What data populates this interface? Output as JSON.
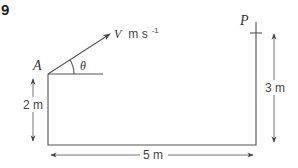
{
  "question_number": "9",
  "points": {
    "A": {
      "label": "A"
    },
    "P": {
      "label": "P"
    }
  },
  "velocity": {
    "symbol": "V",
    "units": "m s",
    "exponent": "-1",
    "angle_symbol": "θ"
  },
  "dimensions": {
    "height_A": "2 m",
    "height_P": "3 m",
    "horizontal": "5 m"
  }
}
